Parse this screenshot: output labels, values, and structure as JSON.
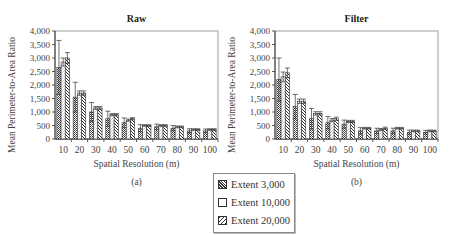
{
  "legend": {
    "items": [
      {
        "label": "Extent 3,000",
        "pattern": "dense-cross"
      },
      {
        "label": "Extent 10,000",
        "pattern": "white"
      },
      {
        "label": "Extent 20,000",
        "pattern": "diagonal"
      }
    ]
  },
  "chart_data": [
    {
      "type": "bar",
      "title": "Raw",
      "caption": "(a)",
      "xlabel": "Spatial Resolution (m)",
      "ylabel": "Mean Perimeter-to-Area Ratio",
      "ylim": [
        0,
        4000
      ],
      "yticks": [
        "0",
        "500",
        "1,000",
        "1,500",
        "2,000",
        "2,500",
        "3,000",
        "3,500",
        "4,000"
      ],
      "categories": [
        "10",
        "20",
        "30",
        "40",
        "50",
        "60",
        "70",
        "80",
        "90",
        "100"
      ],
      "series": [
        {
          "name": "Extent 3,000",
          "values": [
            2650,
            1550,
            1000,
            750,
            600,
            400,
            450,
            400,
            300,
            300
          ],
          "err": [
            1000,
            550,
            350,
            280,
            180,
            130,
            100,
            100,
            80,
            70
          ]
        },
        {
          "name": "Extent 10,000",
          "values": [
            2850,
            1700,
            1150,
            900,
            700,
            500,
            500,
            450,
            350,
            350
          ],
          "err": [
            150,
            80,
            50,
            40,
            40,
            30,
            30,
            30,
            30,
            30
          ]
        },
        {
          "name": "Extent 20,000",
          "values": [
            3000,
            1700,
            1150,
            900,
            750,
            500,
            500,
            450,
            350,
            350
          ],
          "err": [
            200,
            80,
            50,
            40,
            40,
            30,
            30,
            30,
            30,
            30
          ]
        }
      ],
      "grid": false,
      "legend_position": "below"
    },
    {
      "type": "bar",
      "title": "Filter",
      "caption": "(b)",
      "xlabel": "Spatial Resolution (m)",
      "ylabel": "Mean Perimeter-to-Area Ratio",
      "ylim": [
        0,
        4000
      ],
      "yticks": [
        "0",
        "500",
        "1,000",
        "1,500",
        "2,000",
        "2,500",
        "3,000",
        "3,500",
        "4,000"
      ],
      "categories": [
        "10",
        "20",
        "30",
        "40",
        "50",
        "60",
        "70",
        "80",
        "90",
        "100"
      ],
      "series": [
        {
          "name": "Extent 3,000",
          "values": [
            2200,
            1200,
            750,
            600,
            550,
            300,
            300,
            300,
            250,
            250
          ],
          "err": [
            800,
            450,
            380,
            230,
            150,
            120,
            100,
            100,
            80,
            70
          ]
        },
        {
          "name": "Extent 10,000",
          "values": [
            2300,
            1400,
            950,
            700,
            650,
            400,
            350,
            400,
            300,
            300
          ],
          "err": [
            180,
            80,
            60,
            60,
            40,
            30,
            40,
            30,
            30,
            30
          ]
        },
        {
          "name": "Extent 20,000",
          "values": [
            2450,
            1400,
            950,
            750,
            650,
            400,
            400,
            400,
            300,
            300
          ],
          "err": [
            180,
            80,
            60,
            60,
            40,
            30,
            40,
            30,
            30,
            30
          ]
        }
      ],
      "grid": false,
      "legend_position": "below"
    }
  ]
}
